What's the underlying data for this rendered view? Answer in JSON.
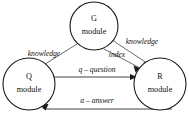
{
  "diagram": {
    "type": "node-link-diagram",
    "nodes": [
      {
        "id": "g",
        "line1": "G",
        "line2": "module",
        "cx": 94,
        "cy": 26,
        "r": 24
      },
      {
        "id": "q",
        "line1": "Q",
        "line2": "module",
        "cx": 29,
        "cy": 84,
        "r": 26
      },
      {
        "id": "r",
        "line1": "R",
        "line2": "module",
        "cx": 160,
        "cy": 84,
        "r": 26
      }
    ],
    "edges": [
      {
        "id": "g-to-q",
        "label": "knowledge",
        "from": "g",
        "to": "q"
      },
      {
        "id": "g-to-r-knowledge",
        "label": "knowledge",
        "from": "g",
        "to": "r"
      },
      {
        "id": "g-to-r-index",
        "label": "index",
        "from": "g",
        "to": "r"
      },
      {
        "id": "q-to-r-question",
        "label": "q – question",
        "from": "q",
        "to": "r"
      },
      {
        "id": "r-to-q-answer",
        "label": "a – answer",
        "from": "r",
        "to": "q"
      }
    ],
    "labels": {
      "knowledge_left": "knowledge",
      "knowledge_right": "knowledge",
      "index": "index",
      "question": "q – question",
      "answer": "a – answer"
    },
    "colors": {
      "background": "#ffffff",
      "node_stroke": "#1a1a1a",
      "edge_stroke": "#5a5a5a",
      "text": "#111111"
    }
  }
}
